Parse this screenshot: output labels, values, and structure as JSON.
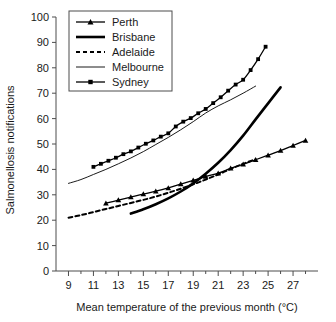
{
  "chart_data": {
    "type": "line",
    "title": "",
    "xlabel": "Mean temperature of the previous month (°C)",
    "ylabel": "Salmonellosis notifications",
    "xlim": [
      8,
      29
    ],
    "ylim": [
      0,
      100
    ],
    "xticks": [
      9,
      11,
      13,
      15,
      17,
      19,
      21,
      23,
      25,
      27
    ],
    "xtick_labels": [
      "9",
      "11",
      "13",
      "15",
      "17",
      "19",
      "21",
      "23",
      "25",
      "27"
    ],
    "xminor_ticks": [
      10,
      12,
      14,
      16,
      18,
      20,
      22,
      24,
      26,
      28
    ],
    "yticks": [
      0,
      10,
      20,
      30,
      40,
      50,
      60,
      70,
      80,
      90,
      100
    ],
    "ytick_labels": [
      "0",
      "10",
      "20",
      "30",
      "40",
      "50",
      "60",
      "70",
      "80",
      "90",
      "100"
    ],
    "grid": false,
    "legend_position": "top-left",
    "series": [
      {
        "name": "Perth",
        "style": "line-with-triangle-markers",
        "marker": "triangle",
        "x": [
          12.0,
          13.0,
          14.0,
          15.0,
          16.0,
          17.0,
          18.0,
          19.0,
          20.0,
          21.0,
          22.0,
          23.0,
          24.0,
          25.0,
          26.0,
          27.0,
          28.0
        ],
        "y": [
          26.7,
          27.9,
          29.1,
          30.3,
          31.4,
          32.7,
          34.2,
          35.7,
          37.2,
          38.5,
          40.4,
          42.0,
          43.8,
          45.6,
          47.4,
          49.4,
          51.4
        ]
      },
      {
        "name": "Brisbane",
        "style": "thick-line",
        "marker": "none",
        "x": [
          14.0,
          15.0,
          16.0,
          17.0,
          18.0,
          19.0,
          20.0,
          21.0,
          22.0,
          23.0,
          24.0,
          25.0,
          26.0
        ],
        "y": [
          22.6,
          24.3,
          26.3,
          28.6,
          31.3,
          34.5,
          38.3,
          42.6,
          47.6,
          53.3,
          59.7,
          66.0,
          72.3
        ]
      },
      {
        "name": "Adelaide",
        "style": "dashed-line",
        "marker": "none",
        "x": [
          9.0,
          10.0,
          11.0,
          12.0,
          13.0,
          14.0,
          15.0,
          16.0,
          17.0,
          18.0,
          19.0,
          20.0,
          21.0,
          22.0,
          23.0,
          24.0
        ],
        "y": [
          21.0,
          22.0,
          23.2,
          24.4,
          25.6,
          26.8,
          28.0,
          29.3,
          30.8,
          32.4,
          34.1,
          36.0,
          38.0,
          40.2,
          42.2,
          44.0
        ]
      },
      {
        "name": "Melbourne",
        "style": "thin-line",
        "marker": "none",
        "x": [
          9.0,
          10.0,
          11.0,
          12.0,
          13.0,
          14.0,
          15.0,
          16.0,
          17.0,
          18.0,
          19.0,
          20.0,
          21.0,
          22.0,
          23.0,
          24.0
        ],
        "y": [
          34.5,
          36.0,
          38.0,
          40.0,
          42.2,
          44.5,
          47.0,
          49.8,
          52.6,
          55.6,
          58.8,
          62.2,
          65.0,
          67.4,
          70.0,
          72.8
        ]
      },
      {
        "name": "Sydney",
        "style": "line-with-square-markers",
        "marker": "square",
        "x": [
          11.0,
          11.6,
          12.2,
          12.8,
          13.4,
          14.0,
          14.6,
          15.2,
          15.8,
          16.4,
          17.0,
          17.6,
          18.2,
          18.8,
          19.4,
          20.0,
          20.6,
          21.2,
          21.8,
          22.4,
          23.0,
          23.6,
          24.2,
          24.8
        ],
        "y": [
          41.0,
          42.2,
          43.4,
          44.6,
          46.0,
          47.1,
          48.6,
          50.1,
          51.4,
          52.9,
          54.2,
          56.9,
          58.8,
          60.2,
          62.1,
          63.8,
          66.1,
          68.4,
          71.0,
          73.4,
          75.3,
          79.1,
          83.4,
          88.3
        ]
      }
    ],
    "legend_entries": [
      {
        "label": "Perth",
        "style": "line-with-triangle-markers"
      },
      {
        "label": "Brisbane",
        "style": "thick-line"
      },
      {
        "label": "Adelaide",
        "style": "dashed-line"
      },
      {
        "label": "Melbourne",
        "style": "thin-line"
      },
      {
        "label": "Sydney",
        "style": "line-with-square-markers"
      }
    ],
    "colors": {
      "line": "#000000",
      "axis": "#4d4d4d",
      "text": "#1a1a1a",
      "background": "#ffffff"
    }
  }
}
